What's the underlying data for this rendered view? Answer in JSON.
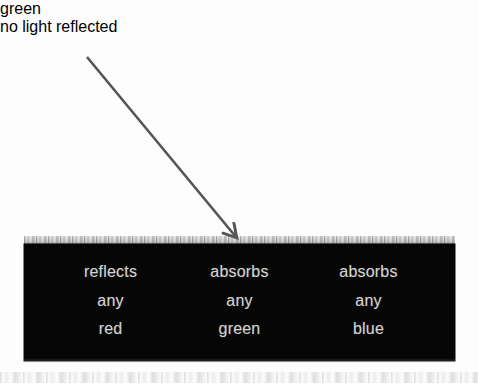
{
  "figure": {
    "width": 478,
    "height": 385,
    "background_color": "#fdfdfd"
  },
  "annotations": {
    "incident_label": "green",
    "reflected_label": "no light\nreflected",
    "text_color": "#1b1b1b"
  },
  "arrow": {
    "name": "incident-light-ray",
    "color": "#555555",
    "stroke_width": 2.6,
    "start": {
      "x": 87,
      "y": 57
    },
    "end": {
      "x": 241,
      "y": 243
    }
  },
  "slab": {
    "name": "black-absorbing-surface",
    "fill_color": "#060606",
    "text_color": "#d2d2d2",
    "bounds": {
      "x": 24,
      "y": 244,
      "width": 431,
      "height": 117
    },
    "columns": [
      {
        "name": "red-channel",
        "lines": [
          "reflects",
          "any",
          "red"
        ]
      },
      {
        "name": "green-channel",
        "lines": [
          "absorbs",
          "any",
          "green"
        ]
      },
      {
        "name": "blue-channel",
        "lines": [
          "absorbs",
          "any",
          "blue"
        ]
      }
    ]
  }
}
